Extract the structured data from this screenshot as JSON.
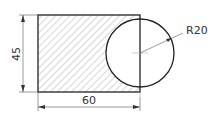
{
  "drawing": {
    "width_label": "60",
    "height_label": "45",
    "radius_label": "R20",
    "colors": {
      "outline": "#222222",
      "hatch": "#777777",
      "dimension": "#333333"
    }
  }
}
